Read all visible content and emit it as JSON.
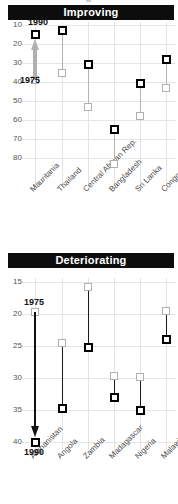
{
  "charts": [
    {
      "id": "improving",
      "banner": "Improving",
      "annotation_top": "1990",
      "annotation_bottom": "1975",
      "arrow_direction": "up",
      "arrow_color": "#b0b0b0",
      "chart_data": {
        "type": "scatter",
        "title": "Improving",
        "xlabel": "",
        "ylabel": "",
        "ylim": [
          8,
          86
        ],
        "y_inverted": true,
        "yticks": [
          10,
          20,
          30,
          40,
          50,
          60,
          70,
          80
        ],
        "grid": true,
        "legend": [
          "1975",
          "1990"
        ],
        "categories": [
          "Mauritania",
          "Thailand",
          "Central African Rep.",
          "Bangladesh",
          "Sri Lanka",
          "Congo"
        ],
        "series": [
          {
            "name": "1975",
            "values": [
              39,
              35,
              53,
              83,
              58,
              43
            ]
          },
          {
            "name": "1990",
            "values": [
              15,
              13,
              31,
              65,
              41,
              28
            ]
          }
        ]
      }
    },
    {
      "id": "deteriorating",
      "banner": "Deteriorating",
      "annotation_top": "1975",
      "annotation_bottom": "1990",
      "arrow_direction": "down",
      "arrow_color": "#111111",
      "chart_data": {
        "type": "scatter",
        "title": "Deteriorating",
        "xlabel": "",
        "ylabel": "",
        "ylim": [
          14,
          41
        ],
        "y_inverted": true,
        "yticks": [
          15,
          20,
          25,
          30,
          35,
          40
        ],
        "grid": true,
        "legend": [
          "1975",
          "1990"
        ],
        "categories": [
          "Afghanistan",
          "Angola",
          "Zambia",
          "Madagascar",
          "Nigeria",
          "Malawi"
        ],
        "series": [
          {
            "name": "1975",
            "values": [
              19.7,
              24.6,
              15.8,
              29.7,
              29.8,
              19.5
            ]
          },
          {
            "name": "1990",
            "values": [
              40.0,
              34.7,
              25.2,
              33.0,
              35.0,
              24.0
            ]
          }
        ]
      }
    }
  ]
}
